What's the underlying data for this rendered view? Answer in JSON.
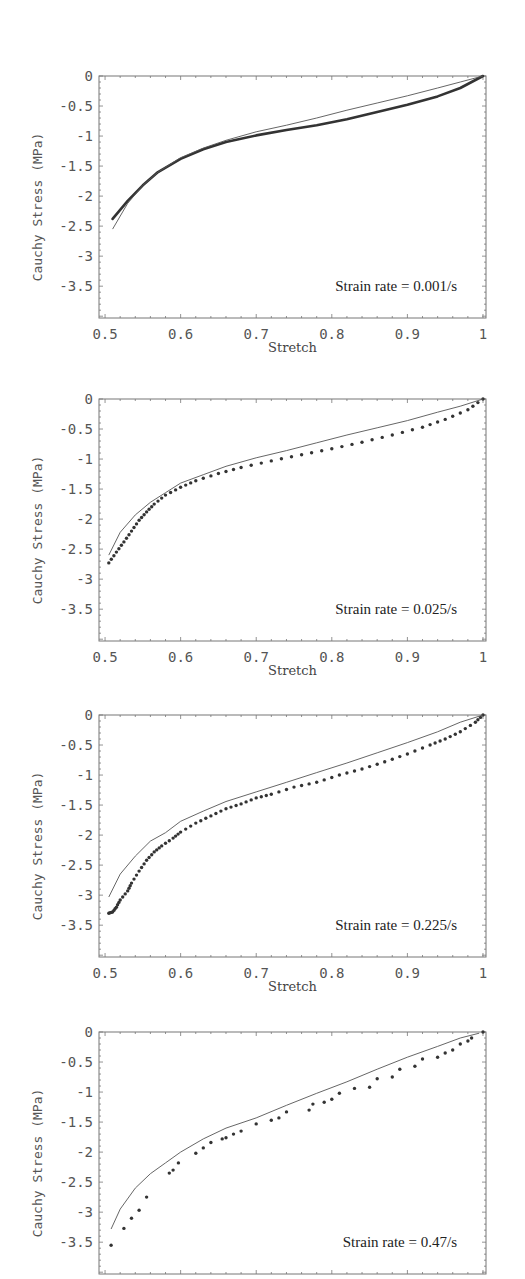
{
  "chart_data": [
    {
      "type": "line",
      "title": "",
      "annotation": "Strain rate = 0.001/s",
      "xlabel": "Stretch",
      "ylabel": "Cauchy Stress (MPa)",
      "xlim": [
        0.492,
        1.004
      ],
      "ylim": [
        -4.03,
        0
      ],
      "xticks": [
        "0.5",
        "0.6",
        "0.7",
        "0.8",
        "0.9",
        "1"
      ],
      "yticks": [
        "0",
        "-0.5",
        "-1",
        "-1.5",
        "-2",
        "-2.5",
        "-3",
        "-3.5"
      ],
      "show_xaxis": true,
      "series": [
        {
          "name": "experiment",
          "style": "dense-markers",
          "x": [
            0.51,
            0.53,
            0.55,
            0.57,
            0.6,
            0.63,
            0.66,
            0.7,
            0.74,
            0.78,
            0.82,
            0.86,
            0.9,
            0.94,
            0.97,
            1.0
          ],
          "y": [
            -2.38,
            -2.08,
            -1.82,
            -1.6,
            -1.38,
            -1.22,
            -1.1,
            -0.99,
            -0.9,
            -0.82,
            -0.72,
            -0.6,
            -0.48,
            -0.34,
            -0.2,
            0.0
          ]
        },
        {
          "name": "model",
          "style": "thin-line",
          "x": [
            0.51,
            0.53,
            0.55,
            0.57,
            0.6,
            0.63,
            0.66,
            0.7,
            0.74,
            0.78,
            0.82,
            0.86,
            0.9,
            0.94,
            0.97,
            1.0
          ],
          "y": [
            -2.55,
            -2.12,
            -1.82,
            -1.6,
            -1.36,
            -1.2,
            -1.07,
            -0.93,
            -0.82,
            -0.7,
            -0.57,
            -0.45,
            -0.33,
            -0.2,
            -0.1,
            0.0
          ]
        }
      ]
    },
    {
      "type": "line",
      "title": "",
      "annotation": "Strain rate = 0.025/s",
      "xlabel": "Stretch",
      "ylabel": "Cauchy Stress (MPa)",
      "xlim": [
        0.492,
        1.004
      ],
      "ylim": [
        -4.03,
        0
      ],
      "xticks": [
        "0.5",
        "0.6",
        "0.7",
        "0.8",
        "0.9",
        "1"
      ],
      "yticks": [
        "0",
        "-0.5",
        "-1",
        "-1.5",
        "-2",
        "-2.5",
        "-3",
        "-3.5"
      ],
      "show_xaxis": true,
      "series": [
        {
          "name": "experiment",
          "style": "markers",
          "x": [
            0.505,
            0.515,
            0.525,
            0.535,
            0.545,
            0.555,
            0.565,
            0.58,
            0.6,
            0.62,
            0.65,
            0.68,
            0.72,
            0.76,
            0.8,
            0.84,
            0.88,
            0.92,
            0.95,
            0.98,
            1.0
          ],
          "y": [
            -2.73,
            -2.55,
            -2.38,
            -2.2,
            -2.02,
            -1.88,
            -1.75,
            -1.6,
            -1.47,
            -1.36,
            -1.24,
            -1.14,
            -1.03,
            -0.93,
            -0.83,
            -0.72,
            -0.6,
            -0.47,
            -0.34,
            -0.18,
            0.0
          ]
        },
        {
          "name": "model",
          "style": "thin-line",
          "x": [
            0.505,
            0.52,
            0.54,
            0.56,
            0.58,
            0.6,
            0.63,
            0.66,
            0.7,
            0.74,
            0.78,
            0.82,
            0.86,
            0.9,
            0.94,
            0.97,
            1.0
          ],
          "y": [
            -2.6,
            -2.22,
            -1.93,
            -1.72,
            -1.56,
            -1.4,
            -1.26,
            -1.12,
            -0.98,
            -0.86,
            -0.73,
            -0.6,
            -0.48,
            -0.36,
            -0.22,
            -0.12,
            0.0
          ]
        }
      ]
    },
    {
      "type": "line",
      "title": "",
      "annotation": "Strain rate = 0.225/s",
      "xlabel": "Stretch",
      "ylabel": "Cauchy Stress (MPa)",
      "xlim": [
        0.492,
        1.004
      ],
      "ylim": [
        -4.03,
        0
      ],
      "xticks": [
        "0.5",
        "0.6",
        "0.7",
        "0.8",
        "0.9",
        "1"
      ],
      "yticks": [
        "0",
        "-0.5",
        "-1",
        "-1.5",
        "-2",
        "-2.5",
        "-3",
        "-3.5"
      ],
      "show_xaxis": true,
      "series": [
        {
          "name": "experiment",
          "style": "markers",
          "x": [
            0.505,
            0.51,
            0.515,
            0.52,
            0.53,
            0.535,
            0.545,
            0.555,
            0.565,
            0.575,
            0.59,
            0.6,
            0.62,
            0.64,
            0.66,
            0.68,
            0.7,
            0.72,
            0.75,
            0.78,
            0.81,
            0.84,
            0.87,
            0.9,
            0.93,
            0.95,
            0.97,
            0.99,
            1.0
          ],
          "y": [
            -3.3,
            -3.28,
            -3.2,
            -3.08,
            -2.93,
            -2.8,
            -2.6,
            -2.42,
            -2.28,
            -2.18,
            -2.05,
            -1.95,
            -1.8,
            -1.68,
            -1.56,
            -1.48,
            -1.38,
            -1.32,
            -1.2,
            -1.12,
            -1.0,
            -0.9,
            -0.78,
            -0.65,
            -0.5,
            -0.4,
            -0.28,
            -0.12,
            0.0
          ]
        },
        {
          "name": "model",
          "style": "thin-line",
          "x": [
            0.505,
            0.52,
            0.54,
            0.56,
            0.58,
            0.6,
            0.63,
            0.66,
            0.7,
            0.74,
            0.78,
            0.82,
            0.86,
            0.9,
            0.94,
            0.97,
            1.0
          ],
          "y": [
            -3.03,
            -2.65,
            -2.35,
            -2.1,
            -1.96,
            -1.77,
            -1.6,
            -1.44,
            -1.28,
            -1.12,
            -0.96,
            -0.8,
            -0.63,
            -0.46,
            -0.28,
            -0.12,
            0.0
          ]
        }
      ]
    },
    {
      "type": "line",
      "title": "",
      "annotation": "Strain rate = 0.47/s",
      "xlabel": "",
      "ylabel": "Cauchy Stress (MPa)",
      "xlim": [
        0.492,
        1.004
      ],
      "ylim": [
        -4.03,
        0
      ],
      "xticks": [],
      "yticks": [
        "0",
        "-0.5",
        "-1",
        "-1.5",
        "-2",
        "-2.5",
        "-3",
        "-3.5"
      ],
      "show_xaxis": false,
      "series": [
        {
          "name": "experiment",
          "style": "sparse-markers",
          "x": [
            0.508,
            0.525,
            0.535,
            0.545,
            0.555,
            0.585,
            0.59,
            0.597,
            0.62,
            0.63,
            0.64,
            0.655,
            0.66,
            0.67,
            0.68,
            0.7,
            0.72,
            0.73,
            0.74,
            0.77,
            0.775,
            0.79,
            0.8,
            0.81,
            0.83,
            0.85,
            0.86,
            0.88,
            0.89,
            0.91,
            0.92,
            0.94,
            0.95,
            0.96,
            0.97,
            0.98,
            0.985,
            1.0
          ],
          "y": [
            -3.55,
            -3.27,
            -3.1,
            -2.97,
            -2.75,
            -2.35,
            -2.3,
            -2.18,
            -2.02,
            -1.93,
            -1.84,
            -1.78,
            -1.76,
            -1.7,
            -1.65,
            -1.53,
            -1.47,
            -1.43,
            -1.33,
            -1.3,
            -1.2,
            -1.17,
            -1.12,
            -1.02,
            -0.94,
            -0.92,
            -0.78,
            -0.75,
            -0.62,
            -0.57,
            -0.45,
            -0.42,
            -0.35,
            -0.3,
            -0.2,
            -0.15,
            -0.1,
            0.0
          ]
        },
        {
          "name": "model",
          "style": "thin-line",
          "x": [
            0.508,
            0.52,
            0.54,
            0.56,
            0.58,
            0.6,
            0.63,
            0.66,
            0.7,
            0.74,
            0.78,
            0.82,
            0.86,
            0.9,
            0.94,
            0.97,
            0.995
          ],
          "y": [
            -3.28,
            -2.95,
            -2.6,
            -2.36,
            -2.18,
            -2.0,
            -1.78,
            -1.6,
            -1.43,
            -1.22,
            -1.02,
            -0.83,
            -0.62,
            -0.42,
            -0.24,
            -0.1,
            -0.02
          ]
        }
      ]
    }
  ],
  "panels": [
    {
      "ylabel": "Cauchy Stress (MPa)",
      "xlabel": "Stretch",
      "annotation": "Strain rate = 0.001/s"
    },
    {
      "ylabel": "Cauchy Stress (MPa)",
      "xlabel": "Stretch",
      "annotation": "Strain rate = 0.025/s"
    },
    {
      "ylabel": "Cauchy Stress (MPa)",
      "xlabel": "Stretch",
      "annotation": "Strain rate = 0.225/s"
    },
    {
      "ylabel": "Cauchy Stress (MPa)",
      "xlabel": "",
      "annotation": "Strain rate = 0.47/s"
    }
  ],
  "colors": {
    "axis": "#777777",
    "model_line": "#555555",
    "markers": "#333333",
    "text": "#555555"
  }
}
